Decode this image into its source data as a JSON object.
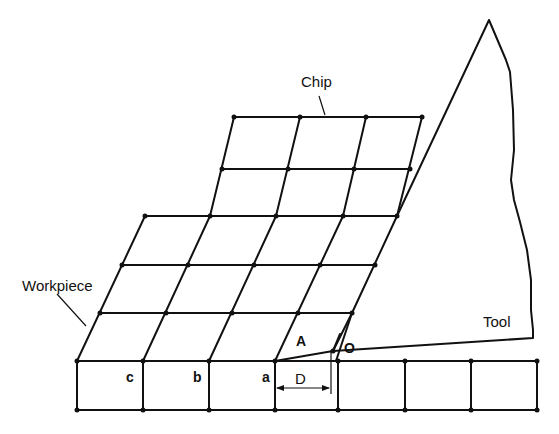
{
  "diagram": {
    "labels": {
      "chip": "Chip",
      "workpiece": "Workpiece",
      "tool": "Tool",
      "point_a": "a",
      "point_b": "b",
      "point_c": "c",
      "point_A": "A",
      "point_O": "O",
      "dimension_D": "D"
    },
    "colors": {
      "line": "#111111",
      "background": "#ffffff"
    }
  }
}
